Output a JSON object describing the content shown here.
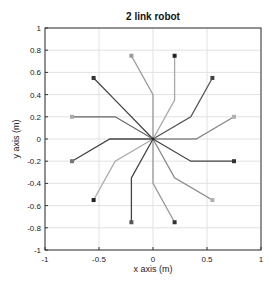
{
  "chart_data": {
    "type": "line",
    "title": "2 link robot",
    "xlabel": "x axis (m)",
    "ylabel": "y axis (m)",
    "xlim": [
      -1,
      1
    ],
    "ylim": [
      -1,
      1
    ],
    "grid": true,
    "xticks": [
      -1,
      -0.5,
      0,
      0.5,
      1
    ],
    "xtick_labels": [
      "-1",
      "-0.5",
      "0",
      "0.5",
      "1"
    ],
    "yticks": [
      1,
      0.8,
      0.6,
      0.4,
      0.2,
      0,
      -0.2,
      -0.4,
      -0.6,
      -0.8,
      -1
    ],
    "ytick_labels": [
      "1",
      "0.8",
      "0.6",
      "0.4",
      "0.2",
      "0",
      "-0.2",
      "-0.4",
      "-0.6",
      "-0.8",
      "-1"
    ],
    "series": [
      {
        "name": "config 1",
        "base": [
          0,
          0
        ],
        "elbow": [
          0.2,
          0.35
        ],
        "end": [
          0.2,
          0.75
        ],
        "color": "#a8a8a8",
        "marker_color": "#222222"
      },
      {
        "name": "config 2",
        "base": [
          0,
          0
        ],
        "elbow": [
          0,
          0.4
        ],
        "end": [
          -0.2,
          0.75
        ],
        "color": "#9a9a9a",
        "marker_color": "#9a9a9a"
      },
      {
        "name": "config 3",
        "base": [
          0,
          0
        ],
        "elbow": [
          -0.35,
          0.35
        ],
        "end": [
          -0.55,
          0.55
        ],
        "color": "#444444",
        "marker_color": "#333333"
      },
      {
        "name": "config 4",
        "base": [
          0,
          0
        ],
        "elbow": [
          0.35,
          0.2
        ],
        "end": [
          0.55,
          0.55
        ],
        "color": "#555555",
        "marker_color": "#444444"
      },
      {
        "name": "config 5",
        "base": [
          0,
          0
        ],
        "elbow": [
          -0.35,
          0.2
        ],
        "end": [
          -0.75,
          0.2
        ],
        "color": "#666666",
        "marker_color": "#aaaaaa"
      },
      {
        "name": "config 6",
        "base": [
          0,
          0
        ],
        "elbow": [
          0.4,
          0
        ],
        "end": [
          0.75,
          0.2
        ],
        "color": "#888888",
        "marker_color": "#b0b0b0"
      },
      {
        "name": "config 7",
        "base": [
          0,
          0
        ],
        "elbow": [
          -0.4,
          0
        ],
        "end": [
          -0.75,
          -0.2
        ],
        "color": "#444444",
        "marker_color": "#777777"
      },
      {
        "name": "config 8",
        "base": [
          0,
          0
        ],
        "elbow": [
          0.35,
          -0.2
        ],
        "end": [
          0.75,
          -0.2
        ],
        "color": "#444444",
        "marker_color": "#333333"
      },
      {
        "name": "config 9",
        "base": [
          0,
          0
        ],
        "elbow": [
          -0.35,
          -0.2
        ],
        "end": [
          -0.55,
          -0.55
        ],
        "color": "#aaaaaa",
        "marker_color": "#222222"
      },
      {
        "name": "config 10",
        "base": [
          0,
          0
        ],
        "elbow": [
          0.2,
          -0.35
        ],
        "end": [
          0.55,
          -0.55
        ],
        "color": "#888888",
        "marker_color": "#b0b0b0"
      },
      {
        "name": "config 11",
        "base": [
          0,
          0
        ],
        "elbow": [
          -0.2,
          -0.35
        ],
        "end": [
          -0.2,
          -0.75
        ],
        "color": "#444444",
        "marker_color": "#555555"
      },
      {
        "name": "config 12",
        "base": [
          0,
          0
        ],
        "elbow": [
          0,
          -0.4
        ],
        "end": [
          0.2,
          -0.75
        ],
        "color": "#999999",
        "marker_color": "#333333"
      }
    ]
  }
}
